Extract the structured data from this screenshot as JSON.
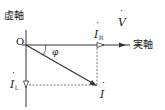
{
  "diagram": {
    "type": "phasor-diagram",
    "axes": {
      "imaginary_label": "虚軸",
      "real_label": "実軸",
      "origin_label": "O"
    },
    "phasors": [
      {
        "id": "V",
        "symbol": "V",
        "subscript": "",
        "dotted": true,
        "direction": "along real axis",
        "arrowhead": "filled"
      },
      {
        "id": "IR",
        "symbol": "I",
        "subscript": "R",
        "dotted": true,
        "direction": "along real axis",
        "arrowhead": "hollow"
      },
      {
        "id": "IL",
        "symbol": "I",
        "subscript": "L",
        "dotted": true,
        "direction": "negative imaginary axis",
        "arrowhead": "hollow"
      },
      {
        "id": "I",
        "symbol": "I",
        "subscript": "",
        "dotted": true,
        "direction": "lagging below real axis",
        "arrowhead": "filled"
      }
    ],
    "angle": {
      "symbol": "φ",
      "between": [
        "V",
        "I"
      ]
    },
    "colors": {
      "line": "#333333",
      "dashed": "#555555",
      "text": "#222222"
    }
  }
}
